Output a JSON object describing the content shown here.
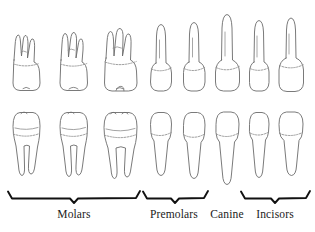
{
  "diagram": {
    "line_color": "#6b6b6b",
    "cej_color": "#8d8d8d",
    "bracket_color": "#111111",
    "label_color": "#1a1a1a",
    "background": "#ffffff",
    "rows": [
      {
        "name": "maxillary-row",
        "description": "Upper (maxillary) teeth, roots directed upward",
        "teeth": [
          {
            "position": 1,
            "name": "third-molar",
            "group": "Molars",
            "roots": 3,
            "cx": 26
          },
          {
            "position": 2,
            "name": "second-molar",
            "group": "Molars",
            "roots": 3,
            "cx": 73
          },
          {
            "position": 3,
            "name": "first-molar",
            "group": "Molars",
            "roots": 3,
            "cx": 120
          },
          {
            "position": 4,
            "name": "second-premolar",
            "group": "Premolars",
            "roots": 1,
            "cx": 161
          },
          {
            "position": 5,
            "name": "first-premolar",
            "group": "Premolars",
            "roots": 1,
            "cx": 194
          },
          {
            "position": 6,
            "name": "canine",
            "group": "Canine",
            "roots": 1,
            "cx": 227
          },
          {
            "position": 7,
            "name": "lateral-incisor",
            "group": "Incisors",
            "roots": 1,
            "cx": 259
          },
          {
            "position": 8,
            "name": "central-incisor",
            "group": "Incisors",
            "roots": 1,
            "cx": 291
          }
        ]
      },
      {
        "name": "mandibular-row",
        "description": "Lower (mandibular) teeth, roots directed downward",
        "teeth": [
          {
            "position": 1,
            "name": "third-molar",
            "group": "Molars",
            "roots": 2,
            "cx": 26
          },
          {
            "position": 2,
            "name": "second-molar",
            "group": "Molars",
            "roots": 2,
            "cx": 73
          },
          {
            "position": 3,
            "name": "first-molar",
            "group": "Molars",
            "roots": 2,
            "cx": 120
          },
          {
            "position": 4,
            "name": "second-premolar",
            "group": "Premolars",
            "roots": 1,
            "cx": 161
          },
          {
            "position": 5,
            "name": "first-premolar",
            "group": "Premolars",
            "roots": 1,
            "cx": 194
          },
          {
            "position": 6,
            "name": "canine",
            "group": "Canine",
            "roots": 1,
            "cx": 227
          },
          {
            "position": 7,
            "name": "lateral-incisor",
            "group": "Incisors",
            "roots": 1,
            "cx": 259
          },
          {
            "position": 8,
            "name": "central-incisor",
            "group": "Incisors",
            "roots": 1,
            "cx": 291
          }
        ]
      }
    ],
    "groups": [
      {
        "id": "molars",
        "label": "Molars",
        "label_x": 74,
        "label_y": 218,
        "bracket": true,
        "x_start": 8,
        "x_end": 140,
        "notch_x": 74
      },
      {
        "id": "premolars",
        "label": "Premolars",
        "label_x": 174,
        "label_y": 218,
        "bracket": true,
        "x_start": 143,
        "x_end": 208,
        "notch_x": 175
      },
      {
        "id": "canine",
        "label": "Canine",
        "label_x": 227,
        "label_y": 218,
        "bracket": false,
        "x_start": 0,
        "x_end": 0,
        "notch_x": 0
      },
      {
        "id": "incisors",
        "label": "Incisors",
        "label_x": 275,
        "label_y": 218,
        "bracket": true,
        "x_start": 241,
        "x_end": 310,
        "notch_x": 275
      }
    ]
  }
}
